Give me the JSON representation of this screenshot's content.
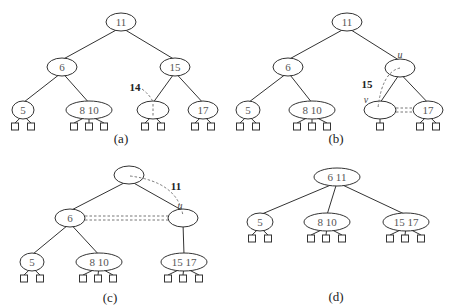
{
  "colors": {
    "line": "#333333",
    "text": "#555555",
    "dashed": "#777777"
  },
  "panels": [
    {
      "id": "a",
      "caption": "(a)",
      "caption_pos": [
        121,
        138
      ],
      "nodes": [
        {
          "id": "a-root",
          "label": "11",
          "x": 121,
          "y": 22,
          "rx": 15,
          "ry": 9
        },
        {
          "id": "a-6",
          "label": "6",
          "x": 62,
          "y": 67,
          "rx": 15,
          "ry": 9
        },
        {
          "id": "a-15",
          "label": "15",
          "x": 175,
          "y": 67,
          "rx": 15,
          "ry": 9
        },
        {
          "id": "a-5",
          "label": "5",
          "x": 23,
          "y": 110,
          "rx": 11,
          "ry": 9
        },
        {
          "id": "a-8-10",
          "label": "8  10",
          "x": 89,
          "y": 110,
          "rx": 23,
          "ry": 9
        },
        {
          "id": "a-empty",
          "label": "",
          "x": 153,
          "y": 110,
          "rx": 16,
          "ry": 9
        },
        {
          "id": "a-17",
          "label": "17",
          "x": 203,
          "y": 110,
          "rx": 15,
          "ry": 9
        }
      ],
      "edges": [
        [
          "a-root",
          "a-6"
        ],
        [
          "a-root",
          "a-15"
        ],
        [
          "a-6",
          "a-5"
        ],
        [
          "a-6",
          "a-8-10"
        ],
        [
          "a-15",
          "a-empty"
        ],
        [
          "a-15",
          "a-17"
        ]
      ],
      "leaves": [
        {
          "parent": "a-5",
          "xs": [
            15,
            31
          ]
        },
        {
          "parent": "a-8-10",
          "xs": [
            74,
            89,
            104
          ]
        },
        {
          "parent": "a-empty",
          "xs": [
            145,
            161
          ]
        },
        {
          "parent": "a-17",
          "xs": [
            195,
            211
          ]
        }
      ],
      "annotations": [
        {
          "type": "label",
          "text": "14",
          "x": 135,
          "y": 87,
          "style": "ann"
        }
      ],
      "dashed": [
        {
          "d": "M 142 89 Q 150 95 153 102"
        },
        {
          "d": "M 153 104 L 153 116"
        }
      ]
    },
    {
      "id": "b",
      "caption": "(b)",
      "caption_pos": [
        336,
        138
      ],
      "nodes": [
        {
          "id": "b-root",
          "label": "11",
          "x": 347,
          "y": 22,
          "rx": 15,
          "ry": 9
        },
        {
          "id": "b-6",
          "label": "6",
          "x": 288,
          "y": 67,
          "rx": 15,
          "ry": 9
        },
        {
          "id": "b-u",
          "label": "",
          "x": 400,
          "y": 68,
          "rx": 15,
          "ry": 9
        },
        {
          "id": "b-5",
          "label": "5",
          "x": 248,
          "y": 110,
          "rx": 12,
          "ry": 9
        },
        {
          "id": "b-8-10",
          "label": "8  10",
          "x": 312,
          "y": 110,
          "rx": 23,
          "ry": 9
        },
        {
          "id": "b-v",
          "label": "",
          "x": 380,
          "y": 110,
          "rx": 16,
          "ry": 9
        },
        {
          "id": "b-17",
          "label": "17",
          "x": 428,
          "y": 110,
          "rx": 15,
          "ry": 9
        }
      ],
      "edges": [
        [
          "b-root",
          "b-6"
        ],
        [
          "b-root",
          "b-u"
        ],
        [
          "b-6",
          "b-5"
        ],
        [
          "b-6",
          "b-8-10"
        ],
        [
          "b-u",
          "b-v"
        ],
        [
          "b-u",
          "b-17"
        ]
      ],
      "leaves": [
        {
          "parent": "b-5",
          "xs": [
            240,
            256
          ]
        },
        {
          "parent": "b-8-10",
          "xs": [
            297,
            312,
            327
          ]
        },
        {
          "parent": "b-v",
          "xs": [
            380
          ]
        },
        {
          "parent": "b-17",
          "xs": [
            420,
            436
          ]
        }
      ],
      "annotations": [
        {
          "type": "label",
          "text": "u",
          "x": 400,
          "y": 54,
          "style": "ital"
        },
        {
          "type": "label",
          "text": "v",
          "x": 366,
          "y": 99,
          "style": "ital"
        },
        {
          "type": "label",
          "text": "15",
          "x": 367,
          "y": 84,
          "style": "ann"
        }
      ],
      "dashed": [
        {
          "d": "M 400 68 Q 382 72 378 108"
        },
        {
          "d": "M 396 108 L 413 108"
        },
        {
          "d": "M 396 112 L 413 112"
        }
      ]
    },
    {
      "id": "c",
      "caption": "(c)",
      "caption_pos": [
        110,
        297
      ],
      "nodes": [
        {
          "id": "c-root",
          "label": "",
          "x": 129,
          "y": 175,
          "rx": 15,
          "ry": 9
        },
        {
          "id": "c-6",
          "label": "6",
          "x": 70,
          "y": 218,
          "rx": 15,
          "ry": 9
        },
        {
          "id": "c-u",
          "label": "",
          "x": 183,
          "y": 218,
          "rx": 15,
          "ry": 9
        },
        {
          "id": "c-5",
          "label": "5",
          "x": 32,
          "y": 262,
          "rx": 12,
          "ry": 9
        },
        {
          "id": "c-8-10",
          "label": "8  10",
          "x": 99,
          "y": 262,
          "rx": 23,
          "ry": 9
        },
        {
          "id": "c-15-17",
          "label": "15  17",
          "x": 184,
          "y": 262,
          "rx": 23,
          "ry": 9
        }
      ],
      "edges": [
        [
          "c-root",
          "c-6"
        ],
        [
          "c-root",
          "c-u"
        ],
        [
          "c-6",
          "c-5"
        ],
        [
          "c-6",
          "c-8-10"
        ],
        [
          "c-u",
          "c-15-17"
        ]
      ],
      "leaves": [
        {
          "parent": "c-5",
          "xs": [
            24,
            40
          ]
        },
        {
          "parent": "c-8-10",
          "xs": [
            83,
            98,
            113
          ]
        },
        {
          "parent": "c-15-17",
          "xs": [
            168,
            183,
            199
          ]
        }
      ],
      "annotations": [
        {
          "type": "label",
          "text": "11",
          "x": 176,
          "y": 186,
          "style": "ann"
        },
        {
          "type": "label",
          "text": "u",
          "x": 180,
          "y": 205,
          "style": "ital"
        }
      ],
      "dashed": [
        {
          "d": "M 130 176 Q 178 182 183 216"
        },
        {
          "d": "M 85 216 L 168 216"
        },
        {
          "d": "M 85 220 L 168 220"
        }
      ]
    },
    {
      "id": "d",
      "caption": "(d)",
      "caption_pos": [
        336,
        296
      ],
      "nodes": [
        {
          "id": "d-root",
          "label": "6  11",
          "x": 337,
          "y": 177,
          "rx": 23,
          "ry": 9
        },
        {
          "id": "d-5",
          "label": "5",
          "x": 260,
          "y": 222,
          "rx": 13,
          "ry": 9
        },
        {
          "id": "d-8-10",
          "label": "8  10",
          "x": 327,
          "y": 222,
          "rx": 23,
          "ry": 9
        },
        {
          "id": "d-15-17",
          "label": "15  17",
          "x": 406,
          "y": 222,
          "rx": 23,
          "ry": 9
        }
      ],
      "edges": [
        [
          "d-root",
          "d-5"
        ],
        [
          "d-root",
          "d-8-10"
        ],
        [
          "d-root",
          "d-15-17"
        ]
      ],
      "leaves": [
        {
          "parent": "d-5",
          "xs": [
            252,
            268
          ]
        },
        {
          "parent": "d-8-10",
          "xs": [
            311,
            326,
            342
          ]
        },
        {
          "parent": "d-15-17",
          "xs": [
            390,
            405,
            421
          ]
        }
      ],
      "annotations": [],
      "dashed": []
    }
  ]
}
